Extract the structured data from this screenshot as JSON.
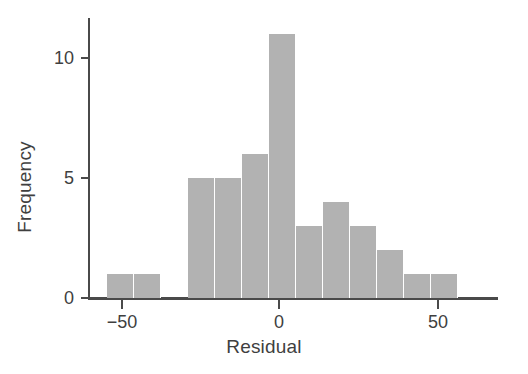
{
  "chart_data": {
    "type": "bar",
    "title": "",
    "xlabel": "Residual",
    "ylabel": "Frequency",
    "xlim": [
      -58.5,
      65
    ],
    "ylim": [
      0,
      11.7
    ],
    "grid": false,
    "legend": null,
    "bin_width": 8.4,
    "bar_color": "#b2b2b2",
    "axis_color": "#4a4a4a",
    "xticks": [
      -50,
      0,
      50
    ],
    "xticklabels": [
      "−50",
      "0",
      "50"
    ],
    "yticks": [
      0,
      5,
      10
    ],
    "yticklabels": [
      "0",
      "5",
      "10"
    ],
    "categories": [
      "-54.2",
      "-45.8",
      "-37.4",
      "-29.0",
      "-20.6",
      "-12.2",
      "-3.8",
      "4.6",
      "13.0",
      "21.4",
      "29.8",
      "38.2",
      "46.6"
    ],
    "bin_edges": [
      -58.4,
      -50.0,
      -41.6,
      -33.2,
      -24.8,
      -16.4,
      -8.0,
      0.4,
      8.8,
      17.2,
      25.6,
      34.0,
      42.4,
      50.8
    ],
    "values": [
      1,
      1,
      0,
      5,
      5,
      6,
      11,
      3,
      4,
      3,
      2,
      1,
      1
    ]
  },
  "bars": [
    {
      "left": 107,
      "width": 27,
      "height": 1,
      "name": "bar-bin-1"
    },
    {
      "left": 134,
      "width": 27,
      "height": 1,
      "name": "bar-bin-2"
    },
    {
      "left": 161,
      "width": 27,
      "height": 0,
      "name": "bar-bin-3"
    },
    {
      "left": 188,
      "width": 27,
      "height": 5,
      "name": "bar-bin-4"
    },
    {
      "left": 215,
      "width": 27,
      "height": 5,
      "name": "bar-bin-5"
    },
    {
      "left": 242,
      "width": 27,
      "height": 6,
      "name": "bar-bin-6"
    },
    {
      "left": 269,
      "width": 27,
      "height": 11,
      "name": "bar-bin-7"
    },
    {
      "left": 296,
      "width": 27,
      "height": 3,
      "name": "bar-bin-8"
    },
    {
      "left": 323,
      "width": 27,
      "height": 4,
      "name": "bar-bin-9"
    },
    {
      "left": 350,
      "width": 27,
      "height": 3,
      "name": "bar-bin-10"
    },
    {
      "left": 377,
      "width": 27,
      "height": 2,
      "name": "bar-bin-11"
    },
    {
      "left": 404,
      "width": 27,
      "height": 1,
      "name": "bar-bin-12"
    },
    {
      "left": 431,
      "width": 27,
      "height": 1,
      "name": "bar-bin-13"
    }
  ],
  "geometry": {
    "baseline_y": 298,
    "y_unit_px": 24,
    "x_zero_px": 279,
    "x_unit_px": 3.15,
    "xtick_px": [
      122,
      279,
      438
    ],
    "ytick_px": [
      298,
      178,
      58
    ]
  }
}
